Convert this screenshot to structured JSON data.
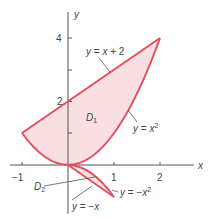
{
  "figure": {
    "axes": {
      "x_label": "x",
      "y_label": "y",
      "x_ticks": [
        {
          "value": -1,
          "label": "−1"
        },
        {
          "value": 1,
          "label": "1"
        },
        {
          "value": 2,
          "label": "2"
        }
      ],
      "y_ticks": [
        {
          "value": 1,
          "label": ""
        },
        {
          "value": 2,
          "label": "2"
        },
        {
          "value": 3,
          "label": ""
        },
        {
          "value": 4,
          "label": "4"
        }
      ]
    },
    "curves": {
      "line_upper": "y = x + 2",
      "parabola_upper": "y = x²",
      "line_lower": "y = −x",
      "parabola_lower": "y = −x²"
    },
    "regions": {
      "d1": {
        "main": "D",
        "sub": "1"
      },
      "d2": {
        "main": "D",
        "sub": "2"
      }
    },
    "colors": {
      "boundary": "#e05060",
      "fill": "#f9dfe1",
      "axis": "#555555",
      "text": "#444444"
    }
  }
}
